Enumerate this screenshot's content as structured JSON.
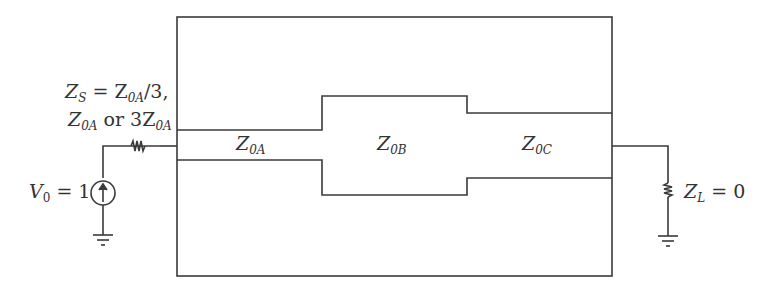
{
  "diagram": {
    "type": "transmission-line-circuit",
    "colors": {
      "line": "#3a3a3a",
      "text": "#333333",
      "background": "#ffffff"
    },
    "source": {
      "label_var": "V",
      "label_sub": "0",
      "label_eq": " = 1",
      "icon": "current-source-arrow-up"
    },
    "source_impedance": {
      "line1_var": "Z",
      "line1_sub": "S",
      "line1_eq": " = Z",
      "line1_sub2": "0A",
      "line1_tail": "/3,",
      "line2_var": "Z",
      "line2_sub": "0A",
      "line2_mid": " or 3Z",
      "line2_sub2": "0A"
    },
    "sections": [
      {
        "var": "Z",
        "sub": "0A"
      },
      {
        "var": "Z",
        "sub": "0B"
      },
      {
        "var": "Z",
        "sub": "0C"
      }
    ],
    "load": {
      "label_var": "Z",
      "label_sub": "L",
      "label_eq": " = 0"
    }
  }
}
